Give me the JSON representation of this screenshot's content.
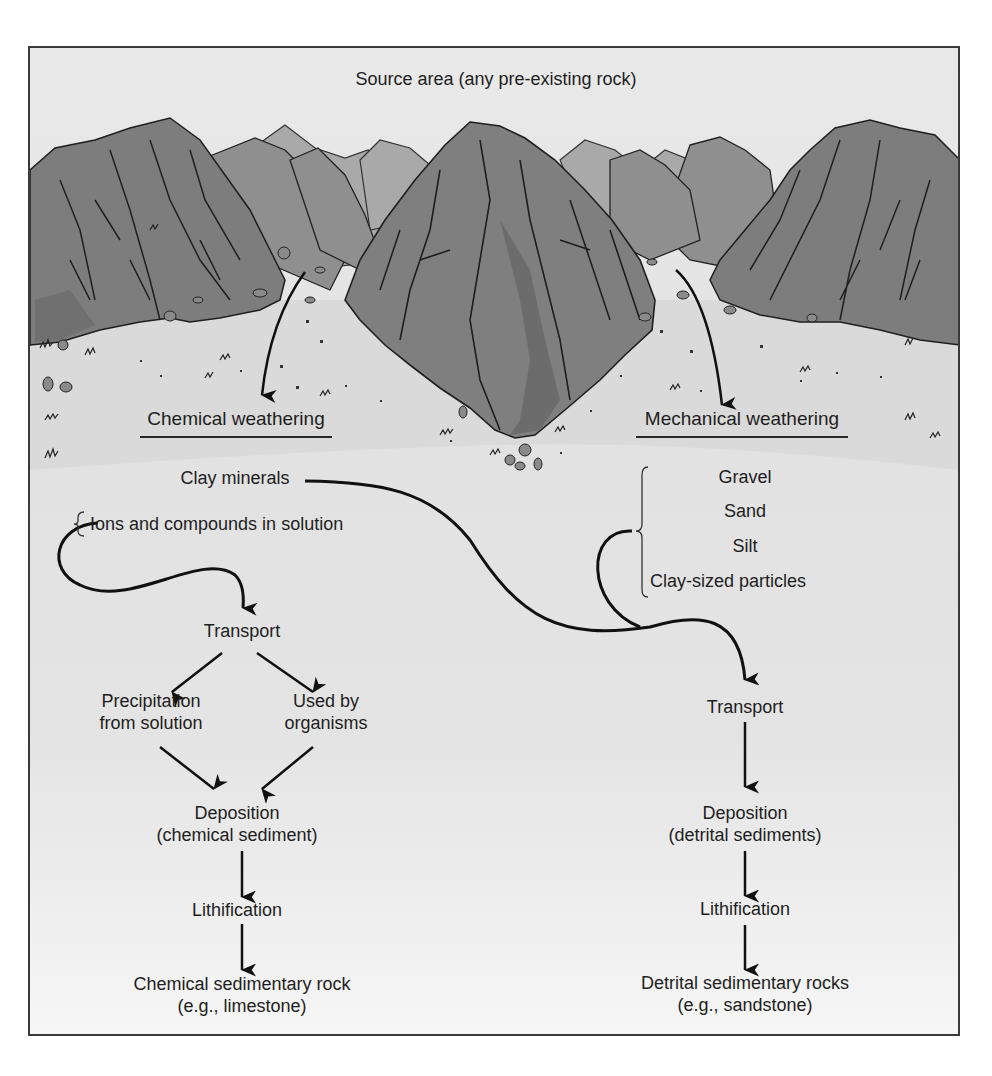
{
  "title": "Source area (any pre-existing rock)",
  "weathering": {
    "chemical": "Chemical weathering",
    "mechanical": "Mechanical weathering"
  },
  "chemical_branch": {
    "clay_minerals": "Clay minerals",
    "ions": "Ions and compounds in solution",
    "transport": "Transport",
    "precipitation_line1": "Precipitation",
    "precipitation_line2": "from solution",
    "organisms_line1": "Used by",
    "organisms_line2": "organisms",
    "deposition_line1": "Deposition",
    "deposition_line2": "(chemical sediment)",
    "lithification": "Lithification",
    "rock_line1": "Chemical sedimentary rock",
    "rock_line2": "(e.g., limestone)"
  },
  "detrital_branch": {
    "particles": [
      "Gravel",
      "Sand",
      "Silt",
      "Clay-sized particles"
    ],
    "transport": "Transport",
    "deposition_line1": "Deposition",
    "deposition_line2": "(detrital sediments)",
    "lithification": "Lithification",
    "rock_line1": "Detrital sedimentary rocks",
    "rock_line2": "(e.g., sandstone)"
  },
  "colors": {
    "mountain_dark": "#7a7a7a",
    "mountain_mid": "#8c8c8c",
    "mountain_far": "#a8a8a8",
    "ground": "#dcdcdc",
    "arrow": "#111111",
    "frame_border": "#3a3a3a"
  }
}
